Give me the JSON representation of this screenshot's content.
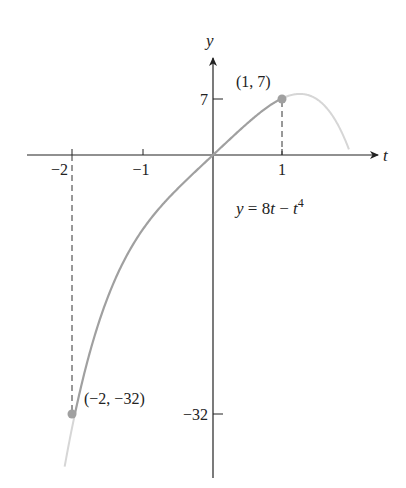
{
  "chart_data": {
    "type": "line",
    "title": "",
    "xlabel": "t",
    "ylabel": "y",
    "equation": "y = 8t − t⁴",
    "equation_parts": {
      "lhs": "y",
      "eq": " = 8",
      "t1": "t",
      "minus": " − ",
      "t2": "t",
      "exp": "4"
    },
    "x_ticks": [
      {
        "value": -2,
        "label": "−2"
      },
      {
        "value": -1,
        "label": "−1"
      },
      {
        "value": 1,
        "label": "1"
      }
    ],
    "y_ticks": [
      {
        "value": 7,
        "label": "7"
      },
      {
        "value": -32,
        "label": "−32"
      }
    ],
    "highlighted_points": [
      {
        "t": 1,
        "y": 7,
        "label": "(1, 7)"
      },
      {
        "t": -2,
        "y": -32,
        "label": "(−2, −32)"
      }
    ],
    "domain_highlighted": [
      -2,
      1
    ],
    "domain_extended": [
      -2.15,
      1.97
    ],
    "series": [
      {
        "name": "y = 8t − t^4 (on [-2,1])",
        "x": [
          -2,
          -1.5,
          -1,
          -0.5,
          0,
          0.5,
          1
        ],
        "values": [
          -32,
          -17.06,
          -9,
          -4.06,
          0,
          3.94,
          7
        ]
      }
    ],
    "grid": false,
    "legend": "none",
    "colors": {
      "axis": "#222222",
      "curve_main": "#a0a0a0",
      "curve_ext": "#d6d6d6",
      "point": "#a0a0a0",
      "dash": "#333333"
    }
  }
}
